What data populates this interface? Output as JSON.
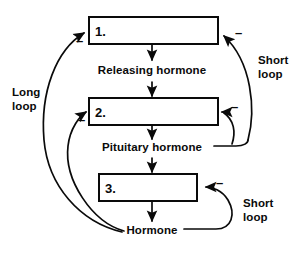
{
  "diagram": {
    "colors": {
      "stroke": "#0a0a0a",
      "background": "#ffffff",
      "box_fill": "#ffffff"
    },
    "boxes": [
      {
        "id": "box-1",
        "label": "1."
      },
      {
        "id": "box-2",
        "label": "2."
      },
      {
        "id": "box-3",
        "label": "3."
      }
    ],
    "flow_labels": [
      {
        "id": "releasing-hormone",
        "text": "Releasing hormone"
      },
      {
        "id": "pituitary-hormone",
        "text": "Pituitary hormone"
      },
      {
        "id": "hormone",
        "text": "Hormone"
      }
    ],
    "loop_labels": [
      {
        "id": "long-loop",
        "line1": "Long",
        "line2": "loop"
      },
      {
        "id": "short-loop-top",
        "line1": "Short",
        "line2": "loop"
      },
      {
        "id": "short-loop-bottom",
        "line1": "Short",
        "line2": "loop"
      }
    ],
    "signs": [
      {
        "id": "sign-box1-left",
        "text": "–"
      },
      {
        "id": "sign-box1-right",
        "text": "–"
      },
      {
        "id": "sign-box2-left",
        "text": "–"
      },
      {
        "id": "sign-box2-right",
        "text": "–"
      },
      {
        "id": "sign-box3-right",
        "text": "–"
      }
    ]
  }
}
